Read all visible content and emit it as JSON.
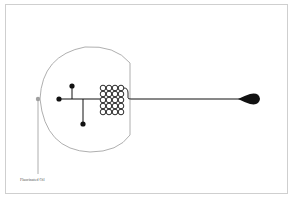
{
  "diagram": {
    "type": "microfluidic-chip",
    "labels": {
      "oil_inlet": "Fluorinated Oil"
    },
    "colors": {
      "outline": "#9a9a9a",
      "channel": "#111111",
      "oil_port": "#a0a0a0",
      "frame": "#cfcfcf"
    }
  }
}
